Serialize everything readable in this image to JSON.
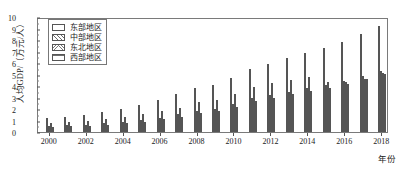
{
  "chart_data": {
    "type": "bar",
    "title": "",
    "xlabel": "年份",
    "ylabel": "人均GDP/（万元/人）",
    "ylim": [
      0,
      10
    ],
    "ytick_labels": [
      "0",
      "1",
      "2",
      "3",
      "4",
      "5",
      "6",
      "7",
      "8",
      "9",
      "10"
    ],
    "xtick_labels": [
      "2000",
      "2002",
      "2004",
      "2006",
      "2008",
      "2010",
      "2012",
      "2014",
      "2016",
      "2018"
    ],
    "grid": false,
    "legend_position": "upper-left",
    "categories": [
      "2000",
      "2001",
      "2002",
      "2003",
      "2004",
      "2005",
      "2006",
      "2007",
      "2008",
      "2009",
      "2010",
      "2011",
      "2012",
      "2013",
      "2014",
      "2015",
      "2016",
      "2017",
      "2018"
    ],
    "series": [
      {
        "name": "东部地区",
        "pattern": "solid-white",
        "values": [
          1.25,
          1.35,
          1.5,
          1.75,
          2.05,
          2.4,
          2.8,
          3.3,
          3.85,
          4.1,
          4.75,
          5.5,
          5.95,
          6.45,
          6.95,
          7.35,
          7.9,
          8.6,
          9.3
        ]
      },
      {
        "name": "中部地区",
        "pattern": "diagonal-hatch",
        "values": [
          0.55,
          0.6,
          0.65,
          0.75,
          0.9,
          1.05,
          1.25,
          1.55,
          1.85,
          2.05,
          2.45,
          2.95,
          3.25,
          3.55,
          3.85,
          4.1,
          4.45,
          4.9,
          5.35
        ]
      },
      {
        "name": "东北地区",
        "pattern": "cross-hatch",
        "values": [
          0.8,
          0.85,
          0.95,
          1.1,
          1.3,
          1.55,
          1.8,
          2.15,
          2.6,
          2.85,
          3.35,
          3.95,
          4.3,
          4.6,
          4.8,
          4.35,
          4.35,
          4.65,
          5.2
        ]
      },
      {
        "name": "西部地区",
        "pattern": "horizontal-hatch",
        "values": [
          0.45,
          0.5,
          0.55,
          0.65,
          0.75,
          0.9,
          1.1,
          1.35,
          1.65,
          1.85,
          2.2,
          2.7,
          3.0,
          3.3,
          3.6,
          3.85,
          4.2,
          4.65,
          5.1
        ]
      }
    ]
  },
  "legend": {
    "items": [
      {
        "label": "东部地区"
      },
      {
        "label": "中部地区"
      },
      {
        "label": "东北地区"
      },
      {
        "label": "西部地区"
      }
    ]
  }
}
